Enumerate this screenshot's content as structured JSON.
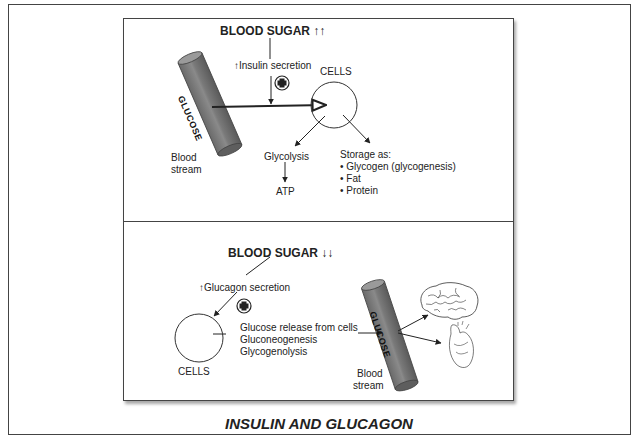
{
  "figure": {
    "title": "INSULIN AND GLUCAGON",
    "colors": {
      "line": "#222222",
      "tube_fill": "#7d7d7d",
      "tube_dark": "#555555",
      "tube_light": "#9a9a9a",
      "border": "#444444"
    }
  },
  "top_panel": {
    "header": "BLOOD SUGAR ↑↑",
    "hormone_label": "↑Insulin secretion",
    "plus_icon": "plus-in-circle",
    "tube_label": "GLUCOSE",
    "blood_stream_line1": "Blood",
    "blood_stream_line2": "stream",
    "cells_label": "CELLS",
    "glycolysis_label": "Glycolysis",
    "atp_label": "ATP",
    "storage_header": "Storage as:",
    "storage_items": [
      "• Glycogen (glycogenesis)",
      "• Fat",
      "• Protein"
    ]
  },
  "bottom_panel": {
    "header": "BLOOD SUGAR ↓↓",
    "hormone_label": "↑Glucagon secretion",
    "plus_icon": "plus-in-circle",
    "cells_label": "CELLS",
    "release_items": [
      "Glucose release from cells",
      "Gluconeogenesis",
      "Glycogenolysis"
    ],
    "tube_label": "GLUCOSE",
    "blood_stream_line1": "Blood",
    "blood_stream_line2": "stream",
    "targets": [
      "brain",
      "heart"
    ]
  }
}
